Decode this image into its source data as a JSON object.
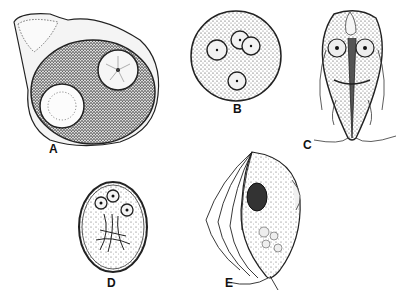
{
  "figure": {
    "panels": [
      {
        "label": "A",
        "subject": "amoeba-trophozoite"
      },
      {
        "label": "B",
        "subject": "amoeba-cyst"
      },
      {
        "label": "C",
        "subject": "giardia-trophozoite"
      },
      {
        "label": "D",
        "subject": "giardia-cyst"
      },
      {
        "label": "E",
        "subject": "flagellate-trophozoite"
      }
    ]
  }
}
